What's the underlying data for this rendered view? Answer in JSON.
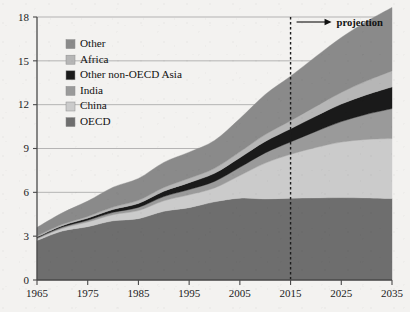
{
  "chart_data": {
    "type": "area",
    "stacked": true,
    "title": "",
    "xlabel": "",
    "ylabel": "",
    "x": [
      1965,
      1970,
      1975,
      1980,
      1985,
      1990,
      1995,
      2000,
      2005,
      2010,
      2015,
      2020,
      2025,
      2030,
      2035
    ],
    "xlim": [
      1965,
      2035
    ],
    "ylim": [
      0,
      18
    ],
    "xticks": [
      "1965",
      "1975",
      "1985",
      "1995",
      "2005",
      "2015",
      "2025",
      "2035"
    ],
    "xtick_values": [
      1965,
      1975,
      1985,
      1995,
      2005,
      2015,
      2025,
      2035
    ],
    "yticks": [
      "0",
      "3",
      "6",
      "9",
      "12",
      "15",
      "18"
    ],
    "ytick_values": [
      0,
      3,
      6,
      9,
      12,
      15,
      18
    ],
    "grid": "horizontal",
    "legend_position": "upper-left-inside",
    "stack_order_bottom_to_top": [
      "OECD",
      "China",
      "India",
      "Other non-OECD Asia",
      "Africa",
      "Other"
    ],
    "series": [
      {
        "name": "OECD",
        "color": "#6e6e6e",
        "values": [
          2.7,
          3.35,
          3.65,
          4.05,
          4.2,
          4.7,
          4.95,
          5.35,
          5.6,
          5.55,
          5.6,
          5.62,
          5.64,
          5.62,
          5.58
        ]
      },
      {
        "name": "China",
        "color": "#cbcbcb",
        "values": [
          0.12,
          0.18,
          0.32,
          0.42,
          0.55,
          0.72,
          0.88,
          0.95,
          1.55,
          2.45,
          3.0,
          3.45,
          3.8,
          4.0,
          4.1
        ]
      },
      {
        "name": "India",
        "color": "#9a9a9a",
        "values": [
          0.06,
          0.09,
          0.12,
          0.16,
          0.22,
          0.29,
          0.36,
          0.45,
          0.56,
          0.7,
          0.85,
          1.1,
          1.4,
          1.72,
          2.05
        ]
      },
      {
        "name": "Other non-OECD Asia",
        "color": "#1a1a1a",
        "values": [
          0.07,
          0.1,
          0.14,
          0.2,
          0.27,
          0.36,
          0.47,
          0.55,
          0.66,
          0.78,
          0.9,
          1.05,
          1.2,
          1.34,
          1.48
        ]
      },
      {
        "name": "Africa",
        "color": "#b6b6b6",
        "values": [
          0.07,
          0.09,
          0.12,
          0.16,
          0.21,
          0.26,
          0.3,
          0.34,
          0.4,
          0.47,
          0.55,
          0.66,
          0.8,
          0.95,
          1.1
        ]
      },
      {
        "name": "Other",
        "color": "#8a8a8a",
        "values": [
          0.58,
          0.79,
          1.05,
          1.36,
          1.5,
          1.72,
          1.79,
          1.91,
          2.28,
          2.75,
          3.05,
          3.42,
          3.76,
          4.07,
          4.34
        ]
      }
    ],
    "totals": [
      3.6,
      4.6,
      5.4,
      6.35,
      6.95,
      8.05,
      8.75,
      9.55,
      11.05,
      12.7,
      13.95,
      15.3,
      16.6,
      17.7,
      18.65
    ],
    "annotations": [
      {
        "name": "projection-divider",
        "label": "projection",
        "at_x": 2015,
        "style": "vertical-dashed-line-with-right-arrow"
      }
    ]
  },
  "legend": {
    "items": [
      {
        "label": "Other",
        "color": "#8a8a8a"
      },
      {
        "label": "Africa",
        "color": "#b6b6b6"
      },
      {
        "label": "Other non-OECD Asia",
        "color": "#1a1a1a"
      },
      {
        "label": "India",
        "color": "#9a9a9a"
      },
      {
        "label": "China",
        "color": "#cbcbcb"
      },
      {
        "label": "OECD",
        "color": "#6e6e6e"
      }
    ]
  },
  "colors": {
    "background": "#f3f2f0",
    "axis": "#4a4a4a",
    "gridline": "#9a9a9a",
    "text": "#111111",
    "divider": "#1b1b1b"
  }
}
